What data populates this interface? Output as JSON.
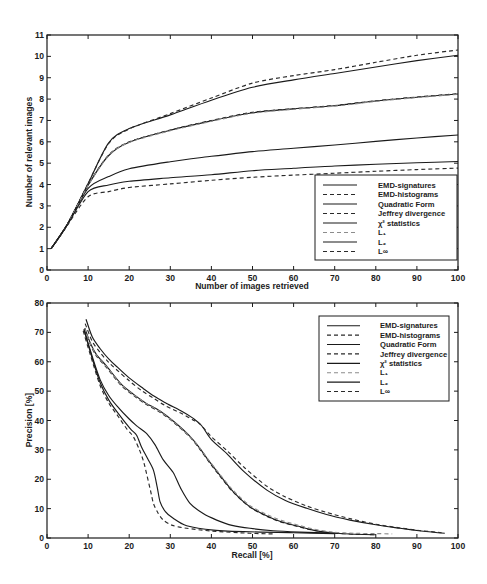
{
  "chart_data": [
    {
      "type": "line",
      "title": "",
      "xlabel": "Number of images retrieved",
      "ylabel": "Number of relevant images",
      "xlim": [
        0,
        100
      ],
      "ylim": [
        0,
        11
      ],
      "xticks": [
        0,
        10,
        20,
        30,
        40,
        50,
        60,
        70,
        80,
        90,
        100
      ],
      "yticks": [
        0,
        1,
        2,
        3,
        4,
        5,
        6,
        7,
        8,
        9,
        10,
        11
      ],
      "grid": false,
      "legend_position": "lower right",
      "axis_color": "#1c1c1c",
      "x": [
        1,
        5,
        10,
        15,
        20,
        30,
        40,
        50,
        60,
        70,
        80,
        90,
        100
      ],
      "series": [
        {
          "name": "EMD-signatures",
          "style": "solid",
          "color": "#1a1a1a",
          "values": [
            1,
            2.15,
            4.05,
            5.95,
            6.62,
            7.26,
            7.95,
            8.55,
            8.9,
            9.2,
            9.5,
            9.8,
            10.05
          ]
        },
        {
          "name": "EMD-histograms",
          "style": "dashed",
          "color": "#2a2a2a",
          "values": [
            1,
            2.15,
            4.05,
            5.92,
            6.6,
            7.32,
            8.05,
            8.75,
            9.1,
            9.38,
            9.72,
            10.05,
            10.3
          ]
        },
        {
          "name": "Quadratic Form",
          "style": "solid",
          "color": "#1a1a1a",
          "values": [
            1,
            2.15,
            3.82,
            4.37,
            4.74,
            5.07,
            5.32,
            5.54,
            5.7,
            5.85,
            6.02,
            6.18,
            6.32
          ]
        },
        {
          "name": "Jeffrey divergence",
          "style": "dashed",
          "color": "#2a2a2a",
          "values": [
            1,
            2.15,
            3.98,
            5.38,
            6.0,
            6.55,
            7.0,
            7.38,
            7.55,
            7.7,
            7.92,
            8.1,
            8.25
          ]
        },
        {
          "name": "χ² statistics",
          "style": "solid",
          "color": "#1a1a1a",
          "values": [
            1,
            2.15,
            3.97,
            5.36,
            5.98,
            6.54,
            6.98,
            7.36,
            7.54,
            7.69,
            7.91,
            8.09,
            8.24
          ]
        },
        {
          "name": "L₁",
          "style": "dashed",
          "color": "#8c8c8c",
          "values": [
            1,
            2.14,
            3.96,
            5.35,
            5.97,
            6.52,
            6.96,
            7.34,
            7.52,
            7.67,
            7.89,
            8.07,
            8.22
          ]
        },
        {
          "name": "L₂",
          "style": "solid",
          "color": "#1a1a1a",
          "values": [
            1,
            2.12,
            3.67,
            3.98,
            4.15,
            4.32,
            4.46,
            4.65,
            4.76,
            4.87,
            4.95,
            5.02,
            5.08
          ]
        },
        {
          "name": "L∞",
          "style": "dashed",
          "color": "#2a2a2a",
          "values": [
            1,
            2.1,
            3.43,
            3.67,
            3.86,
            4.03,
            4.2,
            4.34,
            4.44,
            4.53,
            4.62,
            4.7,
            4.77
          ]
        }
      ]
    },
    {
      "type": "line",
      "title": "",
      "xlabel": "Recall [%]",
      "ylabel": "Precision [%]",
      "xlim": [
        0,
        100
      ],
      "ylim": [
        0,
        80
      ],
      "xticks": [
        0,
        10,
        20,
        30,
        40,
        50,
        60,
        70,
        80,
        90,
        100
      ],
      "yticks": [
        0,
        10,
        20,
        30,
        40,
        50,
        60,
        70,
        80
      ],
      "grid": false,
      "legend_position": "upper right",
      "axis_color": "#1c1c1c",
      "series": [
        {
          "name": "EMD-signatures",
          "style": "solid",
          "color": "#1a1a1a",
          "points": [
            [
              9.5,
              74.5
            ],
            [
              11,
              68.5
            ],
            [
              12.9,
              64.5
            ],
            [
              15,
              61
            ],
            [
              17,
              58.3
            ],
            [
              20,
              54.5
            ],
            [
              23.4,
              50.9
            ],
            [
              26,
              48.3
            ],
            [
              29.1,
              45.8
            ],
            [
              33,
              43
            ],
            [
              35.5,
              40.8
            ],
            [
              37.6,
              38.3
            ],
            [
              40,
              33.5
            ],
            [
              43.7,
              28.8
            ],
            [
              48,
              22.5
            ],
            [
              53.5,
              16.3
            ],
            [
              58,
              12.8
            ],
            [
              63.2,
              10.1
            ],
            [
              68,
              8
            ],
            [
              73.7,
              6.1
            ],
            [
              80,
              4.5
            ],
            [
              85.9,
              3.3
            ],
            [
              91,
              2.4
            ],
            [
              96.8,
              1.6
            ]
          ]
        },
        {
          "name": "EMD-histograms",
          "style": "dashed",
          "color": "#2a2a2a",
          "points": [
            [
              9.3,
              73
            ],
            [
              11,
              67
            ],
            [
              13,
              63
            ],
            [
              15,
              59.8
            ],
            [
              17,
              57.2
            ],
            [
              20,
              53.5
            ],
            [
              23,
              50.2
            ],
            [
              26,
              47.5
            ],
            [
              29,
              44.9
            ],
            [
              33,
              42.2
            ],
            [
              35.5,
              40.2
            ],
            [
              37.2,
              38.8
            ],
            [
              40,
              34.5
            ],
            [
              44,
              29.5
            ],
            [
              48,
              24
            ],
            [
              53.5,
              17.6
            ],
            [
              58,
              14
            ],
            [
              63,
              11
            ],
            [
              68,
              8.7
            ],
            [
              74,
              6.5
            ],
            [
              80,
              4.7
            ],
            [
              86,
              3.4
            ],
            [
              91,
              2.5
            ],
            [
              96,
              1.8
            ]
          ]
        },
        {
          "name": "Quadratic Form",
          "style": "solid",
          "color": "#1a1a1a",
          "points": [
            [
              9,
              71
            ],
            [
              10.5,
              64
            ],
            [
              12.9,
              54
            ],
            [
              15,
              48.5
            ],
            [
              17,
              45
            ],
            [
              20,
              40.5
            ],
            [
              22,
              38
            ],
            [
              24.2,
              35.6
            ],
            [
              26.3,
              31.7
            ],
            [
              28.3,
              26.6
            ],
            [
              30.7,
              22.3
            ],
            [
              32.5,
              17
            ],
            [
              34.8,
              11.8
            ],
            [
              38,
              8.3
            ],
            [
              41.3,
              6.1
            ],
            [
              45,
              4.3
            ],
            [
              49.4,
              3.3
            ],
            [
              55,
              2.5
            ],
            [
              61.5,
              2.0
            ],
            [
              70,
              1.6
            ]
          ]
        },
        {
          "name": "Jeffrey divergence",
          "style": "dashed",
          "color": "#2a2a2a",
          "points": [
            [
              9.1,
              71
            ],
            [
              10.5,
              66
            ],
            [
              12,
              62
            ],
            [
              14.5,
              58
            ],
            [
              18,
              52
            ],
            [
              21,
              48.6
            ],
            [
              24,
              45.6
            ],
            [
              27.5,
              42.8
            ],
            [
              31,
              39.2
            ],
            [
              34.8,
              34.3
            ],
            [
              37.2,
              30.2
            ],
            [
              39.2,
              26.3
            ],
            [
              42,
              21.2
            ],
            [
              45.3,
              15.6
            ],
            [
              49.4,
              10.5
            ],
            [
              53.5,
              7.4
            ],
            [
              57,
              5.4
            ],
            [
              61.6,
              3.7
            ],
            [
              65,
              2.6
            ],
            [
              69.6,
              1.7
            ],
            [
              75,
              1.3
            ],
            [
              80,
              1.1
            ]
          ]
        },
        {
          "name": "χ² statistics",
          "style": "solid",
          "color": "#1a1a1a",
          "points": [
            [
              9.2,
              71.5
            ],
            [
              10.5,
              66.5
            ],
            [
              12,
              62.5
            ],
            [
              14.5,
              58.5
            ],
            [
              18,
              52.5
            ],
            [
              21,
              49
            ],
            [
              24,
              46
            ],
            [
              27.5,
              43.2
            ],
            [
              31,
              39.5
            ],
            [
              34.8,
              34.6
            ],
            [
              37.2,
              30.5
            ],
            [
              39.2,
              26.6
            ],
            [
              42,
              21.5
            ],
            [
              45.3,
              15.8
            ],
            [
              49.4,
              10.6
            ],
            [
              53.5,
              7.5
            ],
            [
              57,
              5.5
            ],
            [
              61.6,
              3.8
            ],
            [
              65,
              2.6
            ],
            [
              69.6,
              1.7
            ],
            [
              75,
              1.3
            ],
            [
              80,
              1.1
            ]
          ]
        },
        {
          "name": "L₁",
          "style": "dashed",
          "color": "#8c8c8c",
          "points": [
            [
              9.2,
              71.3
            ],
            [
              10.5,
              66.3
            ],
            [
              12,
              62.3
            ],
            [
              14.5,
              58.3
            ],
            [
              18,
              52.3
            ],
            [
              21,
              48.9
            ],
            [
              24,
              45.9
            ],
            [
              27.5,
              43.1
            ],
            [
              31,
              39.4
            ],
            [
              34.8,
              34.5
            ],
            [
              37.2,
              30.6
            ],
            [
              39.2,
              26.8
            ],
            [
              42,
              21.8
            ],
            [
              45.3,
              16.2
            ],
            [
              49.4,
              11
            ],
            [
              53.5,
              8
            ],
            [
              57,
              6
            ],
            [
              61.6,
              4.2
            ],
            [
              65,
              3
            ],
            [
              69.6,
              2
            ],
            [
              75,
              1.6
            ],
            [
              80,
              1.5
            ],
            [
              84,
              1.4
            ]
          ]
        },
        {
          "name": "L₂",
          "style": "solid",
          "color": "#1a1a1a",
          "points": [
            [
              9,
              71
            ],
            [
              10.5,
              63.5
            ],
            [
              12.9,
              53
            ],
            [
              15,
              47
            ],
            [
              17,
              43
            ],
            [
              20.2,
              37.3
            ],
            [
              21.8,
              35
            ],
            [
              23,
              31
            ],
            [
              24.5,
              27
            ],
            [
              25.9,
              23.1
            ],
            [
              26.8,
              17.5
            ],
            [
              27.5,
              12.4
            ],
            [
              28.8,
              9
            ],
            [
              30.7,
              6.7
            ],
            [
              34,
              4.2
            ],
            [
              40.5,
              2.7
            ],
            [
              49.4,
              2.1
            ],
            [
              60,
              1.8
            ],
            [
              70,
              1.5
            ]
          ]
        },
        {
          "name": "L∞",
          "style": "dashed",
          "color": "#2a2a2a",
          "points": [
            [
              8.8,
              70.5
            ],
            [
              10.5,
              62.5
            ],
            [
              12.9,
              52
            ],
            [
              15,
              46
            ],
            [
              17,
              42
            ],
            [
              19.5,
              37
            ],
            [
              21,
              34.5
            ],
            [
              22.5,
              30
            ],
            [
              23.5,
              26
            ],
            [
              24.2,
              22
            ],
            [
              25.2,
              16
            ],
            [
              25.9,
              11.8
            ],
            [
              27,
              8.5
            ],
            [
              28.3,
              6.1
            ],
            [
              30.5,
              4.3
            ],
            [
              34,
              3.3
            ],
            [
              40,
              2.4
            ],
            [
              49.4,
              1.6
            ],
            [
              55,
              1.4
            ]
          ]
        }
      ]
    }
  ]
}
